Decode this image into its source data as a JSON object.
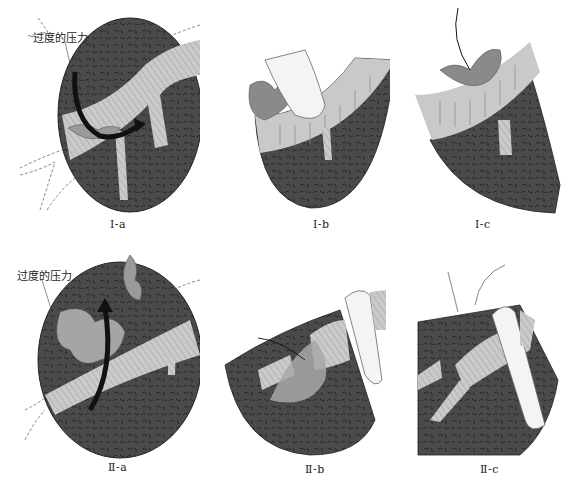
{
  "figure": {
    "annotation": "过度的压力",
    "colors": {
      "tissue": "#4a4a4a",
      "tissue_texture": "#2a2a2a",
      "vessel": "#c9c9c9",
      "vessel_stripes": "#8a8a8a",
      "finger": "#f4f4f4",
      "arrow": "#111111",
      "dashed": "#777777",
      "clot": "#9a9a9a"
    },
    "panels": [
      {
        "id": "I-a",
        "label": "Ⅰ-a",
        "annotation": "过度的压力"
      },
      {
        "id": "I-b",
        "label": "Ⅰ-b"
      },
      {
        "id": "I-c",
        "label": "Ⅰ-c"
      },
      {
        "id": "II-a",
        "label": "Ⅱ-a",
        "annotation": "过度的压力"
      },
      {
        "id": "II-b",
        "label": "Ⅱ-b"
      },
      {
        "id": "II-c",
        "label": "Ⅱ-c"
      }
    ]
  }
}
